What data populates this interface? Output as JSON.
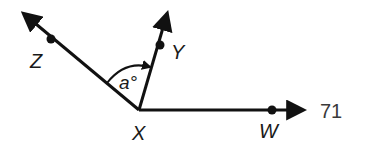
{
  "diagram": {
    "vertex": {
      "label": "X"
    },
    "rays": [
      {
        "name": "XZ",
        "point_label": "Z"
      },
      {
        "name": "XY",
        "point_label": "Y"
      },
      {
        "name": "XW",
        "point_label": "W"
      }
    ],
    "angle": {
      "label": "a°",
      "between": [
        "XZ",
        "XY"
      ]
    },
    "problem_number": "71",
    "colors": {
      "stroke": "#111111",
      "text": "#1a1a1a",
      "number": "#3a3a3a"
    }
  }
}
